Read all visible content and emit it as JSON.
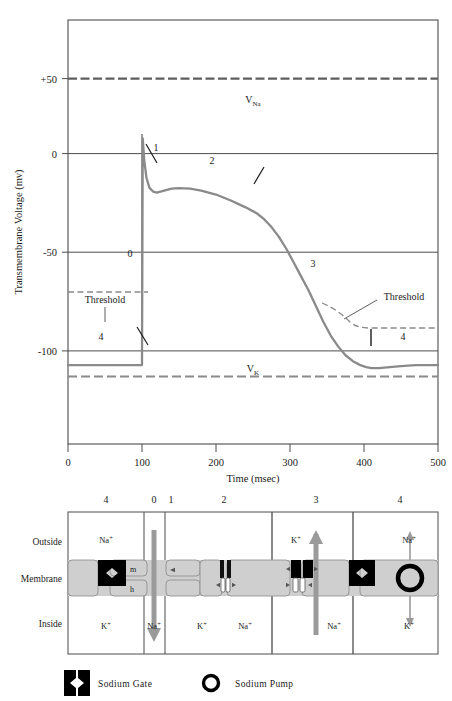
{
  "figure": {
    "colors": {
      "curve": "#8a8a8a",
      "axis": "#4d4d4d",
      "dashed": "#8a8a8a",
      "membrane_fill": "#cfcfcf",
      "gate_fill": "#000000",
      "arrow_gray": "#9a9a9a",
      "text": "#1a1a1a"
    }
  },
  "chart_data": {
    "type": "line",
    "title": "",
    "xlabel": "Time (msec)",
    "ylabel": "Transmembrane Voltage (mv)",
    "xlim": [
      0,
      500
    ],
    "ylim": [
      -130,
      85
    ],
    "xticks": [
      0,
      100,
      200,
      300,
      400,
      500
    ],
    "xticklabels": [
      "0",
      "100",
      "200",
      "300",
      "400",
      "500"
    ],
    "yticks": [
      50,
      0,
      -50,
      -100
    ],
    "yticklabels": [
      "+50",
      "0",
      "-50",
      "-100"
    ],
    "grid": false,
    "legend": "none",
    "series": [
      {
        "name": "Transmembrane action potential",
        "x": [
          0,
          20,
          40,
          60,
          80,
          95,
          100,
          101,
          103,
          106,
          110,
          115,
          120,
          130,
          140,
          150,
          165,
          180,
          200,
          220,
          240,
          255,
          265,
          275,
          285,
          295,
          305,
          315,
          325,
          335,
          345,
          355,
          365,
          375,
          385,
          395,
          403,
          410,
          420,
          435,
          450,
          470,
          500
        ],
        "y": [
          -90,
          -90,
          -90,
          -90,
          -90,
          -90,
          -90,
          25,
          14,
          5,
          0,
          -2,
          -2.5,
          -1.5,
          -0.5,
          -0.3,
          -0.5,
          -1.5,
          -3.5,
          -6.5,
          -10,
          -13,
          -16,
          -20,
          -25,
          -31,
          -38,
          -45,
          -52,
          -60,
          -68,
          -75,
          -80.5,
          -85,
          -88,
          -90,
          -91,
          -91.5,
          -91.5,
          -91,
          -90.5,
          -90,
          -90
        ]
      }
    ],
    "reference_lines": [
      {
        "name": "V_Na",
        "label": "VNa",
        "label_text": "V",
        "label_sub": "Na",
        "value": 50,
        "style": "dashed",
        "color": "#6f6f6f"
      },
      {
        "name": "V_K",
        "label": "VK",
        "label_text": "V",
        "label_sub": "K",
        "value": -113,
        "style": "dashed",
        "color": "#8a8a8a"
      },
      {
        "name": "zero-line",
        "value": 0,
        "style": "solid",
        "color": "#4d4d4d"
      },
      {
        "name": "minus-fifty-line",
        "value": -50,
        "style": "solid",
        "color": "#4d4d4d"
      },
      {
        "name": "minus-hundred-line",
        "value": -100,
        "style": "solid",
        "color": "#4d4d4d"
      }
    ],
    "threshold": {
      "label_left": "Threshold",
      "label_right": "Threshold",
      "resting_value": -70,
      "recovery_note": "elevated and decaying threshold during phase 3-4 recovery"
    },
    "phase_annotations": [
      {
        "label": "4",
        "x": 45,
        "y": -82
      },
      {
        "label": "0",
        "x": 83,
        "y": -33
      },
      {
        "label": "1",
        "x": 118,
        "y": 13
      },
      {
        "label": "2",
        "x": 183,
        "y": 7
      },
      {
        "label": "3",
        "x": 297,
        "y": -44
      },
      {
        "label": "4",
        "x": 440,
        "y": -82
      }
    ]
  },
  "membrane_diagram": {
    "phase_headers": [
      "4",
      "0",
      "1",
      "2",
      "3",
      "4"
    ],
    "row_labels": {
      "outside": "Outside",
      "membrane": "Membrane",
      "inside": "Inside"
    },
    "panels": [
      {
        "phase": "4",
        "outside_ion": "Na",
        "outside_charge": "+",
        "inside_ion": "K",
        "inside_charge": "+",
        "gate_labels": {
          "m": "m",
          "h": "h"
        },
        "flow_arrow": "none"
      },
      {
        "phase": "0",
        "outside_ion": "",
        "outside_charge": "",
        "inside_ion": "Na",
        "inside_charge": "+",
        "gate_labels": {},
        "flow_arrow": "down"
      },
      {
        "phase": "1",
        "outside_ion": "",
        "outside_charge": "",
        "inside_ion": "K",
        "inside_charge": "+",
        "gate_labels": {},
        "flow_arrow": "none"
      },
      {
        "phase": "2",
        "outside_ion": "",
        "outside_charge": "",
        "inside_ion": "Na",
        "inside_charge": "+",
        "gate_labels": {},
        "flow_arrow": "none"
      },
      {
        "phase": "3",
        "outside_ion": "K",
        "outside_charge": "+",
        "inside_ion": "Na",
        "inside_charge": "+",
        "gate_labels": {},
        "flow_arrow": "up"
      },
      {
        "phase": "4",
        "outside_ion": "Na",
        "outside_charge": "+",
        "inside_ion": "K",
        "inside_charge": "+",
        "gate_labels": {},
        "flow_arrow": "pump"
      }
    ],
    "legend": [
      {
        "icon": "sodium-gate-icon",
        "label": "Sodium Gate"
      },
      {
        "icon": "sodium-pump-icon",
        "label": "Sodium Pump"
      }
    ]
  }
}
